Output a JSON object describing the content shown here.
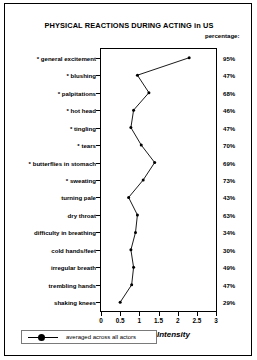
{
  "chart": {
    "title": "PHYSICAL REACTIONS DURING ACTING in US",
    "percentage_header": "percentage:",
    "xaxis_title": "Intensity",
    "legend_label": "averaged across all actors"
  },
  "chart_data": {
    "type": "line",
    "title": "PHYSICAL REACTIONS DURING ACTING in US",
    "xlabel": "Intensity",
    "ylabel": "",
    "xlim": [
      0,
      3
    ],
    "xticks": [
      "0",
      "0.5",
      "1",
      "1.5",
      "2",
      "2.5",
      "3"
    ],
    "xtick_values": [
      0,
      0.5,
      1,
      1.5,
      2,
      2.5,
      3
    ],
    "grid": false,
    "orientation": "horizontal-categories",
    "legend_position": "bottom-left",
    "series": [
      {
        "name": "averaged across all actors",
        "marker": "filled-circle",
        "color": "#000000",
        "values": [
          2.3,
          0.95,
          1.25,
          0.85,
          0.78,
          1.05,
          1.4,
          1.1,
          0.72,
          0.95,
          0.9,
          0.78,
          0.85,
          0.8,
          0.5
        ]
      }
    ],
    "categories": [
      "* general excitement",
      "* blushing",
      "* palpitations",
      "* hot head",
      "* tingling",
      "* tears",
      "* butterflies in stomach",
      "* sweating",
      "turning pale",
      "dry throat",
      "difficulty in breathing",
      "cold hands/feet",
      "irregular breath",
      "trembling hands",
      "shaking knees"
    ],
    "percentages": [
      "95%",
      "47%",
      "68%",
      "46%",
      "47%",
      "70%",
      "69%",
      "73%",
      "43%",
      "63%",
      "34%",
      "30%",
      "49%",
      "47%",
      "29%"
    ]
  }
}
